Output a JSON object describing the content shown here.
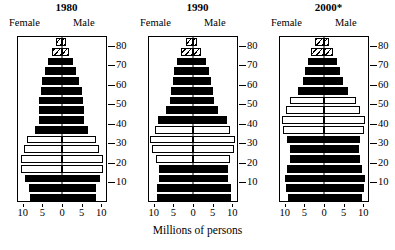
{
  "caption": "Millions of persons",
  "axis": {
    "x_ticks": [
      "10",
      "5",
      "0",
      "5",
      "10"
    ],
    "x_tick_values": [
      -10,
      -5,
      0,
      5,
      10
    ],
    "y_ticks": [
      "10",
      "20",
      "30",
      "40",
      "50",
      "60",
      "70",
      "80"
    ],
    "y_tick_values": [
      10,
      20,
      30,
      40,
      50,
      60,
      70,
      80
    ],
    "female_label": "Female",
    "male_label": "Male"
  },
  "legend_note": "Open bars mark the baby-boom cohort; hatched bars mark the oldest open-ended age groups.",
  "panels": [
    {
      "title": "1980",
      "female_label": "Female",
      "male_label": "Male"
    },
    {
      "title": "1990",
      "female_label": "Female",
      "male_label": "Male"
    },
    {
      "title": "2000*",
      "female_label": "Female",
      "male_label": "Male"
    }
  ],
  "chart_data": {
    "type": "bar",
    "subtype": "population-pyramid",
    "title": "",
    "xlabel": "Millions of persons",
    "ylabel": "Age",
    "xlim": [
      -11.5,
      11.5
    ],
    "ylim": [
      0,
      85
    ],
    "grid": false,
    "legend": "none",
    "age_groups": [
      "0-4",
      "5-9",
      "10-14",
      "15-19",
      "20-24",
      "25-29",
      "30-34",
      "35-39",
      "40-44",
      "45-49",
      "50-54",
      "55-59",
      "60-64",
      "65-69",
      "70-74",
      "75-79",
      "80+"
    ],
    "styles": {
      "solid": "filled black bar",
      "open": "white bar with black outline (baby-boom cohort)",
      "hatch": "diagonally hatched bar (oldest age groups)"
    },
    "panels": [
      {
        "title": "1980",
        "series": [
          {
            "name": "Female",
            "side": "left",
            "values": [
              8.2,
              8.4,
              9.4,
              10.4,
              10.6,
              9.6,
              9.0,
              7.0,
              6.0,
              5.8,
              5.8,
              5.4,
              5.0,
              4.4,
              3.7,
              2.6,
              1.6
            ]
          },
          {
            "name": "Male",
            "side": "right",
            "values": [
              8.6,
              8.7,
              9.8,
              10.4,
              10.5,
              9.5,
              8.8,
              6.7,
              5.7,
              5.5,
              5.4,
              5.0,
              4.4,
              3.7,
              2.8,
              1.7,
              0.9
            ]
          }
        ],
        "bar_styles": [
          "solid",
          "solid",
          "solid",
          "open",
          "open",
          "open",
          "open",
          "solid",
          "solid",
          "solid",
          "solid",
          "solid",
          "solid",
          "solid",
          "solid",
          "hatch",
          "hatch"
        ]
      },
      {
        "title": "1990",
        "series": [
          {
            "name": "Female",
            "side": "left",
            "values": [
              9.1,
              9.2,
              8.6,
              8.7,
              9.4,
              10.6,
              11.0,
              9.8,
              9.0,
              6.8,
              5.8,
              5.5,
              5.2,
              4.8,
              4.2,
              3.0,
              1.9
            ]
          },
          {
            "name": "Male",
            "side": "right",
            "values": [
              9.6,
              9.6,
              9.0,
              9.0,
              9.5,
              10.5,
              10.8,
              9.5,
              8.6,
              6.4,
              5.4,
              5.0,
              4.6,
              4.0,
              3.2,
              2.0,
              1.0
            ]
          }
        ],
        "bar_styles": [
          "solid",
          "solid",
          "solid",
          "solid",
          "open",
          "open",
          "open",
          "open",
          "solid",
          "solid",
          "solid",
          "solid",
          "solid",
          "solid",
          "solid",
          "hatch",
          "hatch"
        ]
      },
      {
        "title": "2000*",
        "series": [
          {
            "name": "Female",
            "side": "left",
            "values": [
              9.2,
              9.8,
              10.0,
              9.4,
              8.8,
              8.8,
              9.4,
              10.4,
              10.8,
              9.6,
              8.8,
              6.6,
              5.4,
              4.8,
              4.2,
              3.2,
              2.4
            ]
          },
          {
            "name": "Male",
            "side": "right",
            "values": [
              9.7,
              10.3,
              10.5,
              9.8,
              9.2,
              9.0,
              9.3,
              10.2,
              10.5,
              9.2,
              8.3,
              6.1,
              4.8,
              4.0,
              3.2,
              2.2,
              1.3
            ]
          }
        ],
        "bar_styles": [
          "solid",
          "solid",
          "solid",
          "solid",
          "solid",
          "solid",
          "solid",
          "open",
          "open",
          "open",
          "open",
          "solid",
          "solid",
          "solid",
          "solid",
          "hatch",
          "hatch"
        ]
      }
    ]
  }
}
